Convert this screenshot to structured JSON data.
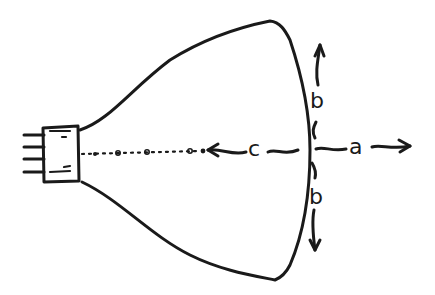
{
  "diagram": {
    "labels": {
      "a": "a",
      "b_top": "b",
      "b_bottom": "b",
      "c": "c"
    },
    "colors": {
      "ink": "#1a1a1a",
      "background": "#ffffff"
    }
  }
}
